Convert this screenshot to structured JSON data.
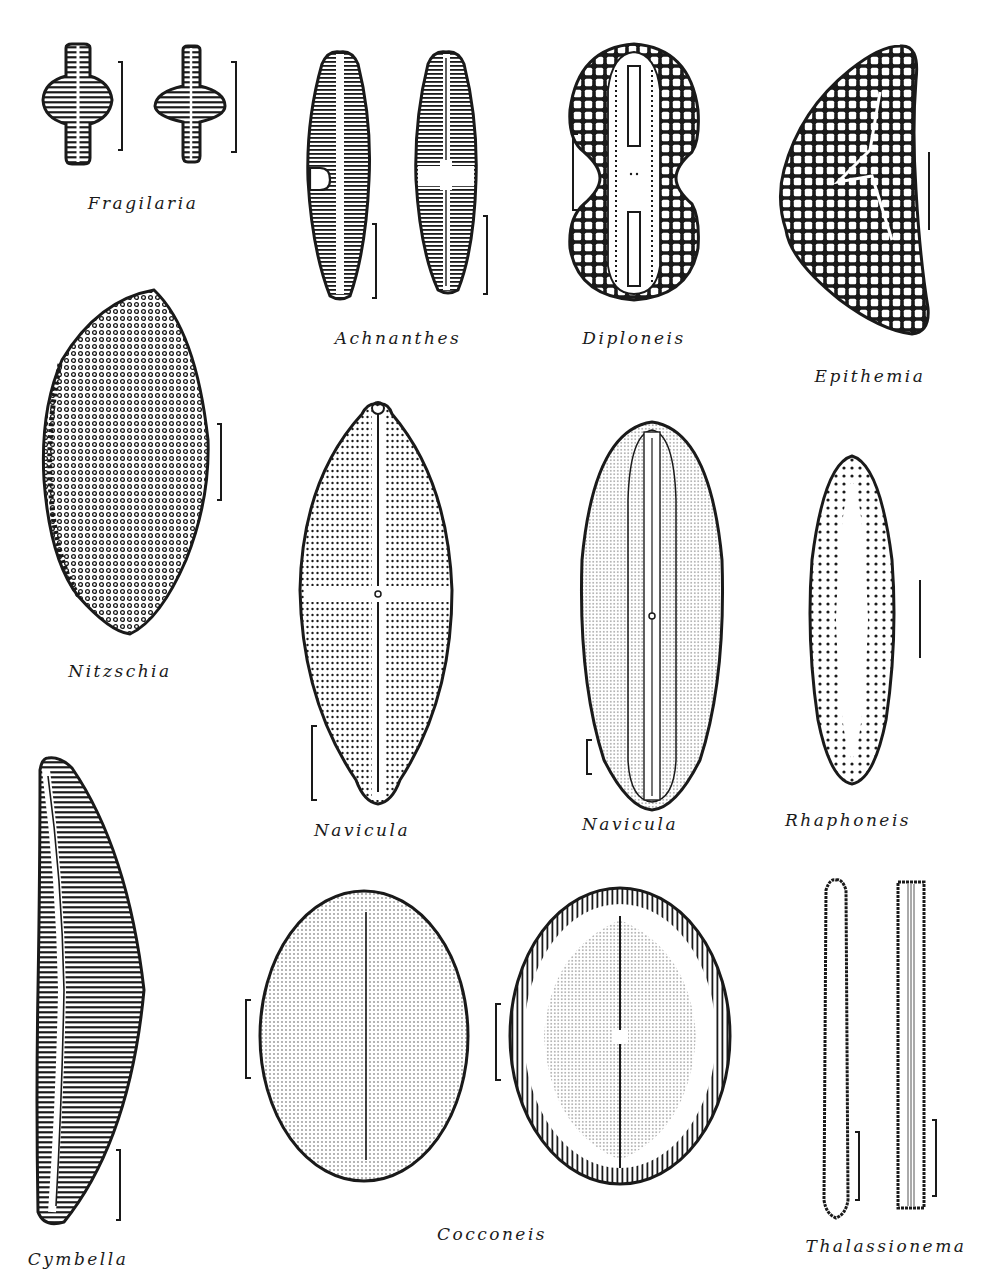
{
  "figure": {
    "type": "diatom-genera-illustration-plate",
    "background": "#ffffff",
    "ink_color": "#1a1a1a",
    "specimens": [
      {
        "id": "fragilaria",
        "label": "Fragilaria",
        "views": 2,
        "scale_bars": 2,
        "label_pos": [
          143,
          205
        ]
      },
      {
        "id": "achnanthes",
        "label": "Achnanthes",
        "views": 2,
        "scale_bars": 2,
        "label_pos": [
          398,
          340
        ]
      },
      {
        "id": "diploneis",
        "label": "Diploneis",
        "views": 1,
        "scale_bars": 1,
        "label_pos": [
          634,
          340
        ]
      },
      {
        "id": "epithemia",
        "label": "Epithemia",
        "views": 1,
        "scale_bars": 1,
        "label_pos": [
          870,
          377
        ]
      },
      {
        "id": "nitzschia",
        "label": "Nitzschia",
        "views": 1,
        "scale_bars": 1,
        "label_pos": [
          120,
          673
        ]
      },
      {
        "id": "navicula-1",
        "label": "Navicula",
        "views": 1,
        "scale_bars": 1,
        "label_pos": [
          362,
          832
        ]
      },
      {
        "id": "navicula-2",
        "label": "Navicula",
        "views": 1,
        "scale_bars": 1,
        "label_pos": [
          630,
          826
        ]
      },
      {
        "id": "rhaphoneis",
        "label": "Rhaphoneis",
        "views": 1,
        "scale_bars": 1,
        "label_pos": [
          848,
          822
        ]
      },
      {
        "id": "cymbella",
        "label": "Cymbella",
        "views": 1,
        "scale_bars": 1,
        "label_pos": [
          78,
          1261
        ]
      },
      {
        "id": "cocconeis",
        "label": "Cocconeis",
        "views": 2,
        "scale_bars": 2,
        "label_pos": [
          492,
          1236
        ]
      },
      {
        "id": "thalassionema",
        "label": "Thalassionema",
        "views": 2,
        "scale_bars": 2,
        "label_pos": [
          886,
          1248
        ]
      }
    ]
  }
}
